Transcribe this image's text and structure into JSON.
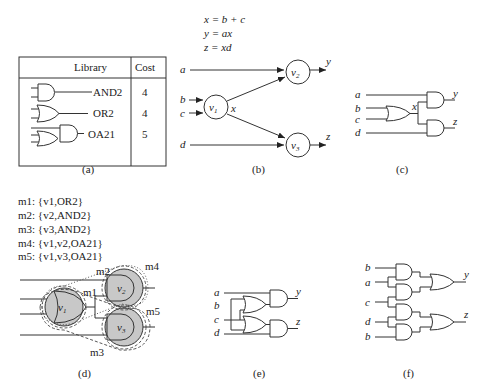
{
  "panels": {
    "a": {
      "caption": "(a)",
      "table": {
        "headers": [
          "Library",
          "Cost"
        ],
        "rows": [
          {
            "gate": "AND2",
            "cost": "4"
          },
          {
            "gate": "OR2",
            "cost": "4"
          },
          {
            "gate": "OA21",
            "cost": "5"
          }
        ]
      }
    },
    "b": {
      "caption": "(b)",
      "equations": [
        "x = b + c",
        "y = ax",
        "z = xd"
      ],
      "inputs": [
        "a",
        "b",
        "c",
        "d"
      ],
      "nodes": [
        "v1",
        "v2",
        "v3"
      ],
      "edge_label": "x",
      "outputs": [
        "y",
        "z"
      ]
    },
    "c": {
      "caption": "(c)",
      "inputs": [
        "a",
        "b",
        "c",
        "d"
      ],
      "internal": "x",
      "outputs": [
        "y",
        "z"
      ]
    },
    "d": {
      "caption": "(d)",
      "matches": [
        "m1:  {v1,OR2}",
        "m2:  {v2,AND2}",
        "m3:  {v3,AND2}",
        "m4:  {v1,v2,OA21}",
        "m5:  {v1,v3,OA21}"
      ],
      "labels": [
        "m1",
        "m2",
        "m3",
        "m4",
        "m5"
      ],
      "nodes": [
        "v1",
        "v2",
        "v3"
      ]
    },
    "e": {
      "caption": "(e)",
      "inputs": [
        "a",
        "b",
        "c",
        "d"
      ],
      "outputs": [
        "y",
        "z"
      ]
    },
    "f": {
      "caption": "(f)",
      "inputs": [
        "b",
        "a",
        "c",
        "d",
        "b"
      ],
      "outputs": [
        "y",
        "z"
      ]
    }
  }
}
